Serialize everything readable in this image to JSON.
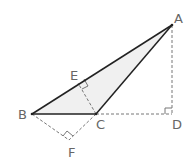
{
  "diagram": {
    "points": {
      "A": {
        "label": "A",
        "x": 172,
        "y": 25
      },
      "B": {
        "label": "B",
        "x": 32,
        "y": 114
      },
      "C": {
        "label": "C",
        "x": 96,
        "y": 114
      },
      "D": {
        "label": "D",
        "x": 171,
        "y": 114
      },
      "E": {
        "label": "E",
        "x": 78,
        "y": 83
      },
      "F": {
        "label": "F",
        "x": 69,
        "y": 140
      }
    },
    "solid_segments": [
      "AB",
      "BC",
      "CA"
    ],
    "dashed_segments": [
      "AD",
      "CD",
      "CE",
      "BF",
      "CF"
    ],
    "right_angles": [
      "D",
      "E",
      "F"
    ],
    "shaded_region": "triangle ABC",
    "colors": {
      "line": "#222222",
      "dashed": "#777777",
      "fill": "#f0f0f0",
      "label": "#666666"
    }
  }
}
